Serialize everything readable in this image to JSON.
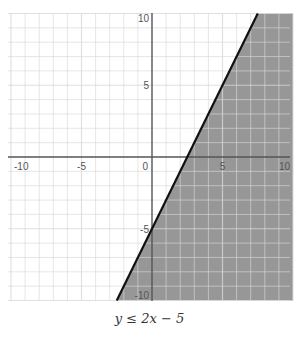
{
  "chart_data": {
    "type": "area",
    "title": "",
    "caption": "y ≤ 2x − 5",
    "xlabel": "",
    "ylabel": "",
    "xlim": [
      -10,
      10
    ],
    "ylim": [
      -10,
      10
    ],
    "grid": true,
    "x_ticks": [
      -10,
      -5,
      0,
      5,
      10
    ],
    "y_ticks": [
      10,
      5,
      -5,
      -10
    ],
    "tick_labels_x": [
      "-10",
      "-5",
      "0",
      "5",
      "10"
    ],
    "tick_labels_y": [
      "10",
      "5",
      "-5",
      "-10"
    ],
    "boundary_line": {
      "equation": "y = 2x - 5",
      "slope": 2,
      "intercept": -5,
      "style": "solid",
      "points": [
        [
          -2.5,
          -10
        ],
        [
          7.5,
          10
        ]
      ]
    },
    "shaded_region": {
      "inequality": "y <= 2x - 5",
      "side": "below-right",
      "polygon": [
        [
          -2.5,
          -10
        ],
        [
          7.5,
          10
        ],
        [
          10,
          10
        ],
        [
          10,
          -10
        ]
      ]
    },
    "colors": {
      "shade": "#8c8c8c",
      "line": "#111111",
      "grid": "#d8d8d8",
      "axis": "#555555"
    }
  },
  "caption": "y ≤ 2x − 5"
}
